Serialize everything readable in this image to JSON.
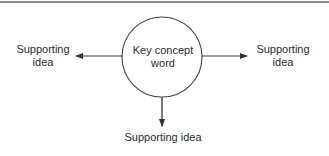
{
  "diagram": {
    "type": "concept-map",
    "center": {
      "line1": "Key concept",
      "line2": "word"
    },
    "left": {
      "line1": "Supporting",
      "line2": "idea"
    },
    "right": {
      "line1": "Supporting",
      "line2": "idea"
    },
    "bottom": {
      "line1": "Supporting idea"
    },
    "colors": {
      "stroke": "#333333",
      "text": "#2b2b2b",
      "top_rule": "#8a8a8a",
      "background": "#ffffff"
    }
  }
}
